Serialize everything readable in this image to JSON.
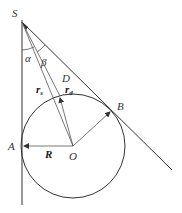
{
  "diagram": {
    "labels": {
      "S": "S",
      "alpha": "α",
      "beta": "β",
      "D": "D",
      "r_s": "r",
      "r_s_sub": "s",
      "r_d": "r",
      "r_d_sub": "d",
      "B": "B",
      "A": "A",
      "R": "R",
      "O": "O"
    },
    "points": {
      "S": [
        22,
        22
      ],
      "O": [
        73,
        146
      ],
      "A": [
        22,
        146
      ],
      "B": [
        112,
        110
      ],
      "D": [
        60,
        96
      ],
      "tangent_end": [
        172,
        170
      ],
      "vertical_end": [
        22,
        205
      ]
    },
    "circle": {
      "cx": 73,
      "cy": 146,
      "r": 52
    },
    "colors": {
      "stroke": "#333333",
      "background": "#ffffff"
    }
  }
}
